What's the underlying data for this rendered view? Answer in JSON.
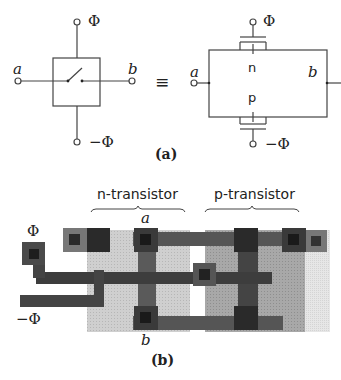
{
  "figure_a": {
    "caption": "(a)",
    "switch": {
      "label_a": "a",
      "label_b": "b",
      "gate_top": "Φ",
      "gate_bottom": "−Φ"
    },
    "equivalence_symbol": "≡",
    "transmission_gate": {
      "label_a": "a",
      "label_b": "b",
      "gate_top": "Φ",
      "gate_bottom": "−Φ",
      "n_label": "n",
      "p_label": "p"
    }
  },
  "figure_b": {
    "caption": "(b)",
    "n_transistor_label": "n-transistor",
    "p_transistor_label": "p-transistor",
    "terminal_a": "a",
    "terminal_b": "b",
    "input_phi": "Φ",
    "input_neg_phi": "−Φ",
    "colors": {
      "metal": "#4a4a4a",
      "contact": "#1e1e1e",
      "n_diffusion": "#c8c8c8",
      "p_diffusion": "#9e9e9e",
      "well_edge": "#e2e2e2",
      "poly": "#3a3a3a"
    }
  }
}
